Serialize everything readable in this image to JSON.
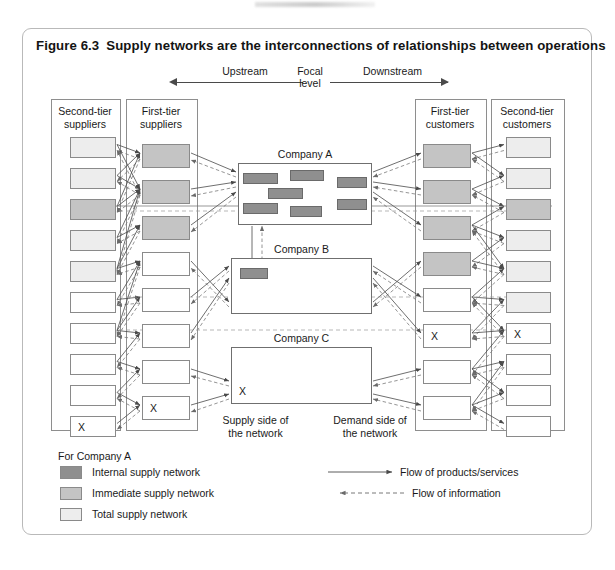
{
  "figure": {
    "number": "Figure 6.3",
    "title": "Supply networks are the interconnections of relationships between operations"
  },
  "axis": {
    "upstream": "Upstream",
    "focal": "Focal\nlevel",
    "focal_line1": "Focal",
    "focal_line2": "level",
    "downstream": "Downstream"
  },
  "columns": [
    {
      "id": "second-tier-suppliers",
      "title_line1": "Second-tier",
      "title_line2": "suppliers",
      "nodes": [
        {
          "shade": "total",
          "label": ""
        },
        {
          "shade": "total",
          "label": ""
        },
        {
          "shade": "immediate",
          "label": ""
        },
        {
          "shade": "total",
          "label": ""
        },
        {
          "shade": "total",
          "label": ""
        },
        {
          "shade": "white",
          "label": ""
        },
        {
          "shade": "white",
          "label": ""
        },
        {
          "shade": "white",
          "label": ""
        },
        {
          "shade": "white",
          "label": ""
        },
        {
          "shade": "white",
          "label": "X"
        }
      ]
    },
    {
      "id": "first-tier-suppliers",
      "title_line1": "First-tier",
      "title_line2": "suppliers",
      "nodes": [
        {
          "shade": "immediate",
          "label": ""
        },
        {
          "shade": "immediate",
          "label": ""
        },
        {
          "shade": "immediate",
          "label": ""
        },
        {
          "shade": "white",
          "label": ""
        },
        {
          "shade": "white",
          "label": ""
        },
        {
          "shade": "white",
          "label": ""
        },
        {
          "shade": "white",
          "label": ""
        },
        {
          "shade": "white",
          "label": "X"
        }
      ]
    },
    {
      "id": "first-tier-customers",
      "title_line1": "First-tier",
      "title_line2": "customers",
      "nodes": [
        {
          "shade": "immediate",
          "label": ""
        },
        {
          "shade": "immediate",
          "label": ""
        },
        {
          "shade": "immediate",
          "label": ""
        },
        {
          "shade": "immediate",
          "label": ""
        },
        {
          "shade": "white",
          "label": ""
        },
        {
          "shade": "white",
          "label": "X"
        },
        {
          "shade": "white",
          "label": ""
        },
        {
          "shade": "white",
          "label": ""
        }
      ]
    },
    {
      "id": "second-tier-customers",
      "title_line1": "Second-tier",
      "title_line2": "customers",
      "nodes": [
        {
          "shade": "total",
          "label": ""
        },
        {
          "shade": "total",
          "label": ""
        },
        {
          "shade": "immediate",
          "label": ""
        },
        {
          "shade": "total",
          "label": ""
        },
        {
          "shade": "total",
          "label": ""
        },
        {
          "shade": "total",
          "label": ""
        },
        {
          "shade": "white",
          "label": "X"
        },
        {
          "shade": "white",
          "label": ""
        },
        {
          "shade": "white",
          "label": ""
        },
        {
          "shade": "white",
          "label": ""
        }
      ]
    }
  ],
  "companies": [
    {
      "id": "company-a",
      "label": "Company A",
      "internal_nodes": 6,
      "x_marker": ""
    },
    {
      "id": "company-b",
      "label": "Company B",
      "internal_nodes": 1,
      "x_marker": ""
    },
    {
      "id": "company-c",
      "label": "Company C",
      "internal_nodes": 0,
      "x_marker": "X"
    }
  ],
  "side_labels": {
    "supply_line1": "Supply side of",
    "supply_line2": "the network",
    "demand_line1": "Demand side of",
    "demand_line2": "the network"
  },
  "legend": {
    "heading": "For Company A",
    "items": [
      {
        "shade": "internal",
        "label": "Internal supply network",
        "color": "#8f8f8f"
      },
      {
        "shade": "immediate",
        "label": "Immediate supply network",
        "color": "#c4c4c4"
      },
      {
        "shade": "total",
        "label": "Total supply network",
        "color": "#ededed"
      }
    ],
    "flows": [
      {
        "type": "solid",
        "label": "Flow of products/services"
      },
      {
        "type": "dashed",
        "label": "Flow of information"
      }
    ]
  },
  "colors": {
    "internal": "#8f8f8f",
    "immediate": "#c4c4c4",
    "total": "#ededed",
    "white": "#ffffff",
    "stroke": "#8a8a8a",
    "frame": "#b9b9b9"
  }
}
